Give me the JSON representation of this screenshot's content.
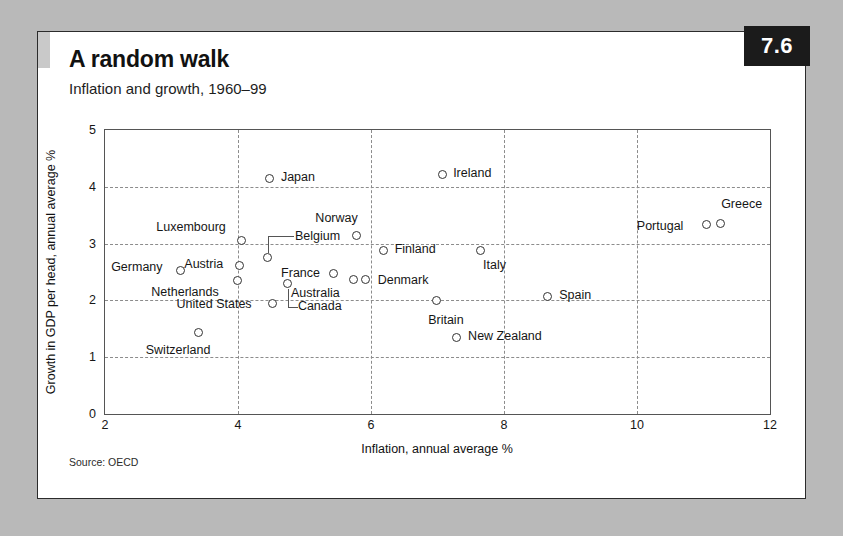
{
  "figure": {
    "number_badge": "7.6",
    "title": "A random walk",
    "subtitle": "Inflation and growth, 1960–99",
    "source": "Source: OECD"
  },
  "chart_data": {
    "type": "scatter",
    "title": "A random walk",
    "subtitle": "Inflation and growth, 1960–99",
    "xlabel": "Inflation, annual average %",
    "ylabel": "Growth in GDP per head, annual average %",
    "xlim": [
      2,
      12
    ],
    "ylim": [
      0,
      5
    ],
    "xticks": [
      "2",
      "4",
      "6",
      "8",
      "10",
      "12"
    ],
    "yticks": [
      "0",
      "1",
      "2",
      "3",
      "4",
      "5"
    ],
    "grid": "dashed gridlines at every tick, both axes",
    "legend": "none",
    "marker": "open circle, dark outline, white fill",
    "points": [
      {
        "name": "Japan",
        "x": 4.48,
        "y": 4.15,
        "label_side": "right"
      },
      {
        "name": "Ireland",
        "x": 7.07,
        "y": 4.22,
        "label_side": "right"
      },
      {
        "name": "Greece",
        "x": 11.25,
        "y": 3.36,
        "label_side": "above-right"
      },
      {
        "name": "Portugal",
        "x": 11.05,
        "y": 3.33,
        "label_side": "left"
      },
      {
        "name": "Norway",
        "x": 5.78,
        "y": 3.14,
        "label_side": "above"
      },
      {
        "name": "Luxembourg",
        "x": 4.05,
        "y": 3.06,
        "label_side": "above-left"
      },
      {
        "name": "Belgium",
        "x": 4.45,
        "y": 2.75,
        "label_side": "leader-right"
      },
      {
        "name": "Austria",
        "x": 4.02,
        "y": 2.62,
        "label_side": "left"
      },
      {
        "name": "Finland",
        "x": 6.19,
        "y": 2.88,
        "label_side": "right"
      },
      {
        "name": "Italy",
        "x": 7.64,
        "y": 2.88,
        "label_side": "below-right"
      },
      {
        "name": "Germany",
        "x": 3.13,
        "y": 2.52,
        "label_side": "left"
      },
      {
        "name": "France",
        "x": 5.43,
        "y": 2.47,
        "label_side": "left"
      },
      {
        "name": "Netherlands",
        "x": 3.99,
        "y": 2.35,
        "label_side": "below-left"
      },
      {
        "name": "Australia",
        "x": 5.73,
        "y": 2.36,
        "label_side": "below-left"
      },
      {
        "name": "Denmark",
        "x": 5.92,
        "y": 2.36,
        "label_side": "right"
      },
      {
        "name": "Canada",
        "x": 4.75,
        "y": 2.3,
        "label_side": "leader-below"
      },
      {
        "name": "Spain",
        "x": 8.65,
        "y": 2.07,
        "label_side": "right"
      },
      {
        "name": "United States",
        "x": 4.52,
        "y": 1.95,
        "label_side": "left"
      },
      {
        "name": "Britain",
        "x": 6.98,
        "y": 1.99,
        "label_side": "below"
      },
      {
        "name": "New Zealand",
        "x": 7.28,
        "y": 1.35,
        "label_side": "right"
      },
      {
        "name": "Switzerland",
        "x": 3.41,
        "y": 1.43,
        "label_side": "below-left"
      }
    ]
  }
}
